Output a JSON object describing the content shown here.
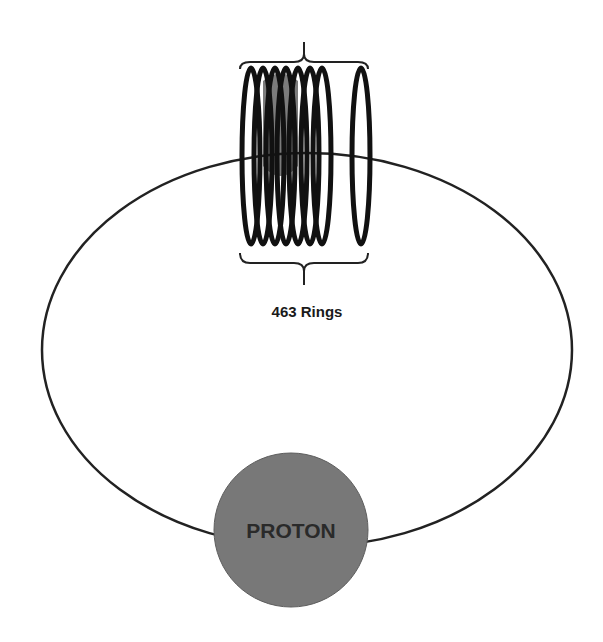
{
  "diagram": {
    "ring_count_label": "463 Rings",
    "nucleus_label": "PROTON",
    "colors": {
      "background": "#ffffff",
      "orbit_stroke": "#222222",
      "ring_stroke": "#111111",
      "proton_fill": "#787878",
      "proton_text": "#2a2a2a",
      "label_text": "#1a1a1a"
    },
    "orbit": {
      "cx": 307,
      "cy": 350,
      "rx": 265,
      "ry": 197
    },
    "rings": {
      "stacked_centers_x": [
        251,
        263,
        275,
        286,
        298,
        310,
        322
      ],
      "separate_center_x": 361,
      "cy": 156,
      "rx": 9,
      "ry": 88,
      "stroke_width": 5
    },
    "proton": {
      "cx": 291,
      "cy": 530,
      "r": 77
    },
    "top_brace": {
      "x1": 240,
      "x2": 368,
      "y_end": 69,
      "y_line": 62,
      "tip_x": 304,
      "tip_y": 42
    },
    "bottom_brace": {
      "x1": 240,
      "x2": 368,
      "y_end": 253,
      "y_line": 263,
      "tip_x": 304,
      "tip_y": 285
    }
  }
}
